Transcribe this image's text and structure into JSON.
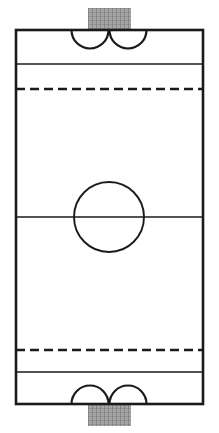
{
  "diagram": {
    "type": "sports-field-plan",
    "orientation": "vertical",
    "canvas": {
      "width": 219,
      "height": 433
    },
    "colors": {
      "line": "#1a1a1a",
      "surface": "#ffffff",
      "goal_net": "#9a9a9a",
      "goal_net_grid": "#6e6e6e"
    },
    "style": {
      "boundary_stroke_width": 2.6,
      "interior_stroke_width": 1.6,
      "dash_pattern": "9 5"
    },
    "field": {
      "label": "playing-surface",
      "x": 16,
      "y": 30,
      "width": 187,
      "height": 374
    },
    "lines": [
      {
        "name": "top-restraining-line",
        "kind": "solid",
        "orientation": "horizontal",
        "y": 64,
        "x1": 16,
        "x2": 203
      },
      {
        "name": "top-dashed-line",
        "kind": "dashed",
        "orientation": "horizontal",
        "y": 89,
        "x1": 16,
        "x2": 203
      },
      {
        "name": "center-line",
        "kind": "solid",
        "orientation": "horizontal",
        "y": 217,
        "x1": 16,
        "x2": 203
      },
      {
        "name": "bottom-dashed-line",
        "kind": "dashed",
        "orientation": "horizontal",
        "y": 350,
        "x1": 16,
        "x2": 203
      },
      {
        "name": "bottom-restraining-line",
        "kind": "solid",
        "orientation": "horizontal",
        "y": 372,
        "x1": 16,
        "x2": 203
      }
    ],
    "center_circle": {
      "name": "center-circle",
      "cx": 109,
      "cy": 217,
      "r": 35
    },
    "crease_arcs": [
      {
        "name": "top-left-crease-arc",
        "cx": 90,
        "cy": 30,
        "r": 18.5,
        "side": "top",
        "direction": "below-line"
      },
      {
        "name": "top-right-crease-arc",
        "cx": 128,
        "cy": 30,
        "r": 18.5,
        "side": "top",
        "direction": "below-line"
      },
      {
        "name": "bottom-left-crease-arc",
        "cx": 90,
        "cy": 404,
        "r": 18.5,
        "side": "bottom",
        "direction": "above-line"
      },
      {
        "name": "bottom-right-crease-arc",
        "cx": 128,
        "cy": 404,
        "r": 18.5,
        "side": "bottom",
        "direction": "above-line"
      }
    ],
    "goals": [
      {
        "name": "top-goal",
        "x": 88,
        "y": 8,
        "width": 43,
        "height": 22,
        "position": "outside-top-boundary"
      },
      {
        "name": "bottom-goal",
        "x": 88,
        "y": 404,
        "width": 43,
        "height": 22,
        "position": "outside-bottom-boundary"
      }
    ]
  }
}
